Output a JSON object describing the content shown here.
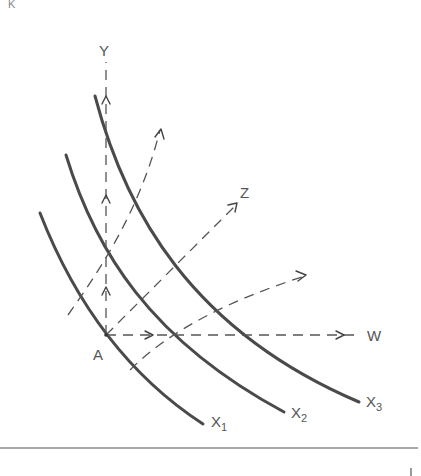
{
  "figure": {
    "corner_mark": "K",
    "origin_label": "A",
    "axis_labels": {
      "vertical": "Y",
      "diagonal": "Z",
      "horizontal": "W"
    },
    "curves": [
      {
        "name": "X",
        "subscript": "1"
      },
      {
        "name": "X",
        "subscript": "2"
      },
      {
        "name": "X",
        "subscript": "3"
      }
    ],
    "colors": {
      "curve": "#4a4a4a",
      "dashed_path": "#555555",
      "label": "#555555",
      "background": "#ffffff"
    }
  }
}
